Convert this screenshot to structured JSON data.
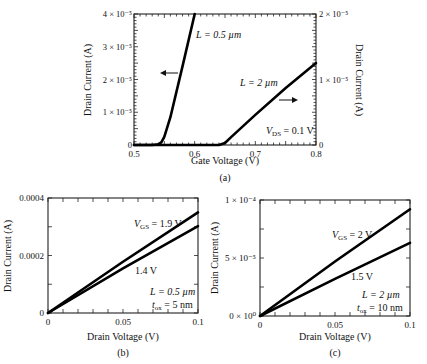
{
  "chart_data": [
    {
      "id": "a",
      "type": "line",
      "caption": "(a)",
      "xlabel": "Gate Voltage (V)",
      "ylabel_left": "Drain Current (A)",
      "ylabel_right": "Drain Current (A)",
      "xlim": [
        0.5,
        0.8
      ],
      "xticks": [
        "0.5",
        "0.6",
        "0.7",
        "0.8"
      ],
      "ylim_left": [
        0,
        4e-05
      ],
      "yticks_left": [
        "0",
        "1 × 10⁻⁵",
        "2 × 10⁻⁵",
        "3 × 10⁻⁵",
        "4 × 10⁻⁵"
      ],
      "ylim_right": [
        0,
        2e-05
      ],
      "yticks_right": [
        "0",
        "1 × 10⁻⁵",
        "2 × 10⁻⁵"
      ],
      "annotation": "V_DS = 0.1 V",
      "series": [
        {
          "name": "L = 0.5 µm",
          "axis": "left",
          "x": [
            0.5,
            0.53,
            0.54,
            0.545,
            0.55,
            0.56,
            0.58,
            0.6
          ],
          "y": [
            0,
            0,
            2e-07,
            8e-07,
            2.5e-06,
            8.5e-06,
            2.4e-05,
            4e-05
          ]
        },
        {
          "name": "L = 2 µm",
          "axis": "right",
          "x": [
            0.5,
            0.64,
            0.65,
            0.66,
            0.7,
            0.75,
            0.8
          ],
          "y": [
            0,
            0,
            3e-07,
            1.2e-06,
            4.6e-06,
            8.7e-06,
            1.25e-05
          ]
        }
      ]
    },
    {
      "id": "b",
      "type": "line",
      "caption": "(b)",
      "xlabel": "Drain Voltage (V)",
      "ylabel": "Drain Current (A)",
      "xlim": [
        0,
        0.1
      ],
      "xticks": [
        "0",
        "0.05",
        "0.1"
      ],
      "ylim": [
        0,
        0.0004
      ],
      "yticks": [
        "0",
        "0.0002",
        "0.0004"
      ],
      "annotations": [
        "L = 0.5 µm",
        "t_ox = 5 nm"
      ],
      "series": [
        {
          "name": "V_GS = 1.9 V",
          "x": [
            0,
            0.05,
            0.1
          ],
          "y": [
            0,
            0.000178,
            0.00035
          ]
        },
        {
          "name": "1.4 V",
          "x": [
            0,
            0.05,
            0.1
          ],
          "y": [
            0,
            0.000155,
            0.000302
          ]
        }
      ]
    },
    {
      "id": "c",
      "type": "line",
      "caption": "(c)",
      "xlabel": "Drain Voltage (V)",
      "ylabel": "Drain Current (A)",
      "xlim": [
        0,
        0.1
      ],
      "xticks": [
        "0",
        "0.05",
        "0.1"
      ],
      "ylim": [
        0,
        0.0001
      ],
      "yticks": [
        "0 × 10⁰",
        "5 × 10⁻⁵",
        "1 × 10⁻⁴"
      ],
      "annotations": [
        "L = 2 µm",
        "t_ox = 10 nm"
      ],
      "series": [
        {
          "name": "V_GS = 2 V",
          "x": [
            0,
            0.05,
            0.1
          ],
          "y": [
            0,
            4.7e-05,
            9.2e-05
          ]
        },
        {
          "name": "1.5 V",
          "x": [
            0,
            0.05,
            0.1
          ],
          "y": [
            0,
            3.2e-05,
            6.3e-05
          ]
        }
      ]
    }
  ],
  "labels": {
    "a": {
      "curve1": "L = 0.5 µm",
      "curve2": "L = 2 µm",
      "vds_v": "V",
      "vds_sub": "DS",
      "vds_rest": " = 0.1 V",
      "caption": "(a)",
      "xlabel": "Gate Voltage (V)",
      "ylabel_left": "Drain Current (A)",
      "ylabel_right": "Drain Current (A)"
    },
    "b": {
      "vgs_v": "V",
      "vgs_sub": "GS",
      "vgs_rest": " = 1.9 V",
      "curve2": "1.4 V",
      "L": "L = 0.5 µm",
      "tox_t": "t",
      "tox_sub": "ox",
      "tox_rest": " = 5 nm",
      "caption": "(b)",
      "xlabel": "Drain Voltage (V)",
      "ylabel": "Drain Current (A)"
    },
    "c": {
      "vgs_v": "V",
      "vgs_sub": "GS",
      "vgs_rest": " = 2 V",
      "curve2": "1.5 V",
      "L": "L = 2 µm",
      "tox_t": "t",
      "tox_sub": "ox",
      "tox_rest": " = 10 nm",
      "caption": "(c)",
      "xlabel": "Drain Voltage (V)",
      "ylabel": "Drain Current (A)"
    }
  }
}
